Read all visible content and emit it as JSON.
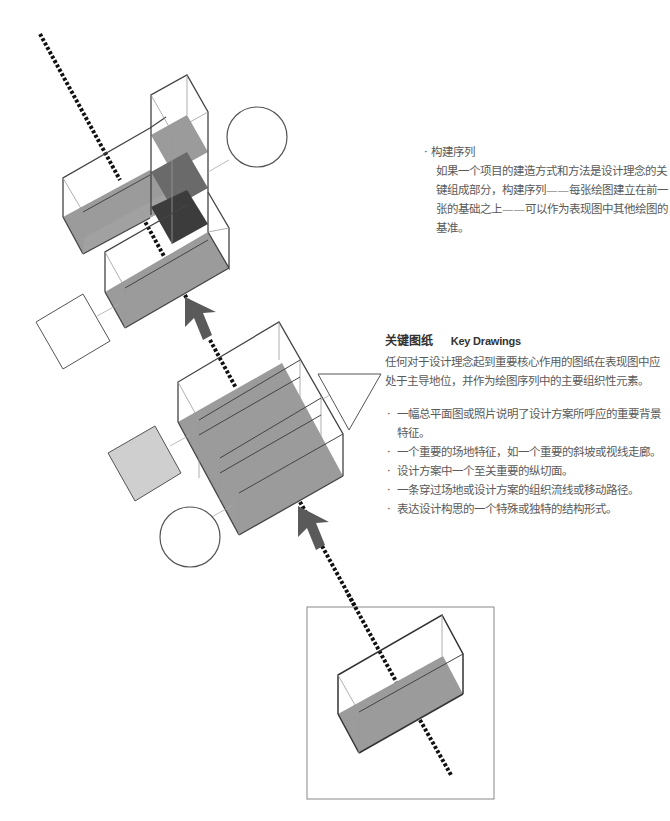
{
  "diagram": {
    "colors": {
      "line": "#444444",
      "thin_line": "#9a9a9a",
      "fill_mid": "#9b9b9b",
      "fill_dark": "#6a6a6a",
      "fill_darker": "#3c3c3c",
      "fill_light": "#cfcfcf",
      "arrow": "#5a5a5a",
      "axis_dots": "#111111"
    },
    "elements": [
      "dotted-axis-line",
      "top-composite-volumes",
      "circle-symbol-top",
      "square-symbol-left-top",
      "arrow-up-1",
      "center-cube-volume",
      "triangle-symbol",
      "gray-square-symbol",
      "circle-symbol-bottom",
      "arrow-up-2",
      "framed-single-volume"
    ]
  },
  "sequence": {
    "title": "构建序列",
    "body": "如果一个项目的建造方式和方法是设计理念的关键组成部分，构建序列——每张绘图建立在前一张的基础之上——可以作为表现图中其他绘图的基准。"
  },
  "key_drawings": {
    "title_cn": "关键图纸",
    "title_en": "Key Drawings",
    "intro": "任何对于设计理念起到重要核心作用的图纸在表现图中应处于主导地位，并作为绘图序列中的主要组织性元素。",
    "bullets": [
      "一幅总平面图或照片说明了设计方案所呼应的重要背景特征。",
      "一个重要的场地特征，如一个重要的斜坡或视线走廊。",
      "设计方案中一个至关重要的纵切面。",
      "一条穿过场地或设计方案的组织流线或移动路径。",
      "表达设计构思的一个特殊或独特的结构形式。"
    ]
  }
}
